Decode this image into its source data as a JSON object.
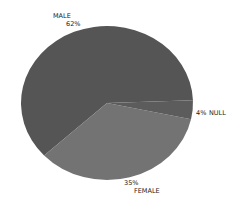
{
  "chart_data": {
    "type": "pie",
    "title": "",
    "categories": [
      "MALE",
      "FEMALE",
      "NULL"
    ],
    "values": [
      62,
      35,
      4
    ],
    "unit": "%",
    "colors": [
      "#555555",
      "#737373",
      "#5c5c5c"
    ],
    "legend": false,
    "labels": [
      {
        "name": "MALE",
        "pct": "62%"
      },
      {
        "name": "FEMALE",
        "pct": "35%"
      },
      {
        "name": "NULL",
        "pct": "4%"
      }
    ]
  }
}
